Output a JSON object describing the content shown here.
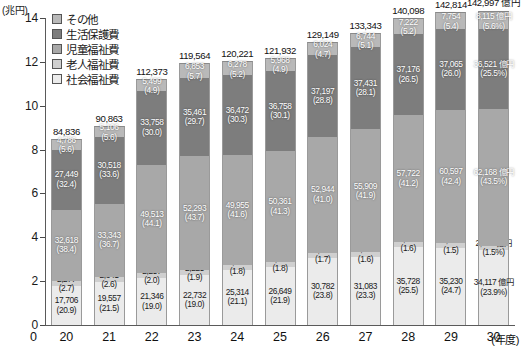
{
  "axis": {
    "y_unit": "(兆円)",
    "y_ticks": [
      "14",
      "12",
      "10",
      "8",
      "6",
      "4",
      "2",
      "0"
    ],
    "y_min": 0,
    "y_max": 14,
    "x_unit": "(年度)",
    "x_zero": "0"
  },
  "legend": {
    "items": [
      {
        "label": "その他",
        "color": "#b9b9b9"
      },
      {
        "label": "生活保護費",
        "color": "#7d7d7d"
      },
      {
        "label": "児童福祉費",
        "color": "#a8a8a8"
      },
      {
        "label": "老人福祉費",
        "color": "#cfcfcf"
      },
      {
        "label": "社会福祉費",
        "color": "#ebebeb"
      }
    ]
  },
  "chart_data": {
    "type": "bar",
    "subtype": "stacked-column",
    "title": "",
    "xlabel": "(年度)",
    "ylabel": "(兆円)",
    "ylim": [
      0,
      14
    ],
    "grid": false,
    "legend_position": "top-left",
    "unit_note": "億円",
    "categories": [
      "20",
      "21",
      "22",
      "23",
      "24",
      "25",
      "26",
      "27",
      "28",
      "29",
      "30"
    ],
    "totals": [
      "84,836",
      "90,863",
      "112,373",
      "119,564",
      "120,221",
      "121,932",
      "129,149",
      "133,343",
      "140,098",
      "142,814",
      "142,997 億円"
    ],
    "totals_numeric": [
      84836,
      90863,
      112373,
      119564,
      120221,
      121932,
      129149,
      133343,
      140098,
      142814,
      142997
    ],
    "series": [
      {
        "name": "社会福祉費",
        "color": "#ebebeb",
        "values": [
          17706,
          19557,
          21346,
          22732,
          25314,
          26649,
          30782,
          31083,
          35728,
          35230,
          34117
        ],
        "labels": [
          "17,706",
          "19,557",
          "21,346",
          "22,732",
          "25,314",
          "26,649",
          "30,782",
          "31,083",
          "35,728",
          "35,230",
          "34,117 億円"
        ],
        "pct": [
          "(20.9)",
          "(21.5)",
          "(19.0)",
          "(19.0)",
          "(21.1)",
          "(21.9)",
          "(23.8)",
          "(23.3)",
          "(25.5)",
          "(24.7)",
          "(23.9%)"
        ]
      },
      {
        "name": "老人福祉費",
        "color": "#cfcfcf",
        "values": [
          2277,
          2341,
          2257,
          2225,
          2202,
          2196,
          2202,
          2176,
          2200,
          2168,
          2076
        ],
        "labels": [
          "2,277",
          "2,341",
          "2,257",
          "2,225",
          "2,202",
          "2,196",
          "2,202",
          "2,176",
          "2,200",
          "2,168",
          "2,076 億円"
        ],
        "pct": [
          "(2.7)",
          "(2.6)",
          "(2.0)",
          "(1.9)",
          "(1.8)",
          "(1.8)",
          "(1.7)",
          "(1.6)",
          "(1.6)",
          "(1.5)",
          "(1.5%)"
        ]
      },
      {
        "name": "児童福祉費",
        "color": "#a8a8a8",
        "values": [
          32618,
          33343,
          49513,
          52293,
          49955,
          50361,
          52944,
          55909,
          57722,
          60597,
          62168
        ],
        "labels": [
          "32,618",
          "33,343",
          "49,513",
          "52,293",
          "49,955",
          "50,361",
          "52,944",
          "55,909",
          "57,722",
          "60,597",
          "62,168 億円"
        ],
        "pct": [
          "(38.4)",
          "(36.7)",
          "(44.1)",
          "(43.7)",
          "(41.6)",
          "(41.3)",
          "(41.0)",
          "(41.9)",
          "(41.2)",
          "(42.4)",
          "(43.5%)"
        ]
      },
      {
        "name": "生活保護費",
        "color": "#7d7d7d",
        "values": [
          27449,
          30518,
          33758,
          35461,
          36472,
          36758,
          37197,
          37431,
          37176,
          37065,
          36521
        ],
        "labels": [
          "27,449",
          "30,518",
          "33,758",
          "35,461",
          "36,472",
          "36,758",
          "37,197",
          "37,431",
          "37,176",
          "37,065",
          "36,521 億円"
        ],
        "pct": [
          "(32.4)",
          "(33.6)",
          "(30.0)",
          "(29.7)",
          "(30.3)",
          "(30.1)",
          "(28.8)",
          "(28.1)",
          "(26.5)",
          "(26.0)",
          "(25.5%)"
        ]
      },
      {
        "name": "その他",
        "color": "#b9b9b9",
        "values": [
          4786,
          5106,
          5499,
          6853,
          6278,
          5968,
          6024,
          6744,
          7222,
          7754,
          8115
        ],
        "labels": [
          "4,786",
          "5,106",
          "5,499",
          "6,853",
          "6,278",
          "5,968",
          "6,024",
          "6,744",
          "7,222",
          "7,754",
          "8,115 億円"
        ],
        "pct": [
          "(5.6)",
          "(5.6)",
          "(4.9)",
          "(5.7)",
          "(5.2)",
          "(4.9)",
          "(4.7)",
          "(5.1)",
          "(5.2)",
          "(5.4)",
          "(5.6%)"
        ]
      }
    ]
  }
}
